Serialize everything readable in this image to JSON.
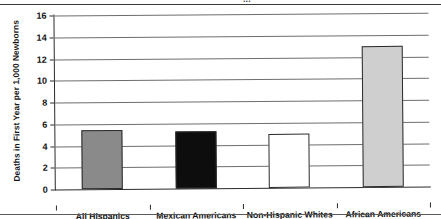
{
  "figure": {
    "clipped_running_title": "...",
    "bottom_rule": true,
    "top_rule": true
  },
  "chart_data": {
    "type": "bar",
    "title": "",
    "xlabel": "",
    "ylabel": "Deaths in First Year per 1,000 Newborns",
    "categories": [
      "All Hispanics",
      "Mexican Americans",
      "Non-Hispanic Whites",
      "African Americans"
    ],
    "values": [
      5.4,
      5.2,
      5.0,
      13.0
    ],
    "bar_colors": [
      "#8a8a8a",
      "#0d0d0d",
      "#ffffff",
      "#cfcfcf"
    ],
    "bar_border_color": "#2b2b2b",
    "ylim": [
      0,
      16
    ],
    "ytick_step": 2,
    "ytick_labels": [
      "0",
      "2",
      "4",
      "6",
      "8",
      "10",
      "12",
      "14",
      "16"
    ],
    "ytick_values": [
      0,
      2,
      4,
      6,
      8,
      10,
      12,
      14,
      16
    ],
    "grid": true,
    "grid_axis": "y",
    "legend": false,
    "legend_position": "none"
  }
}
